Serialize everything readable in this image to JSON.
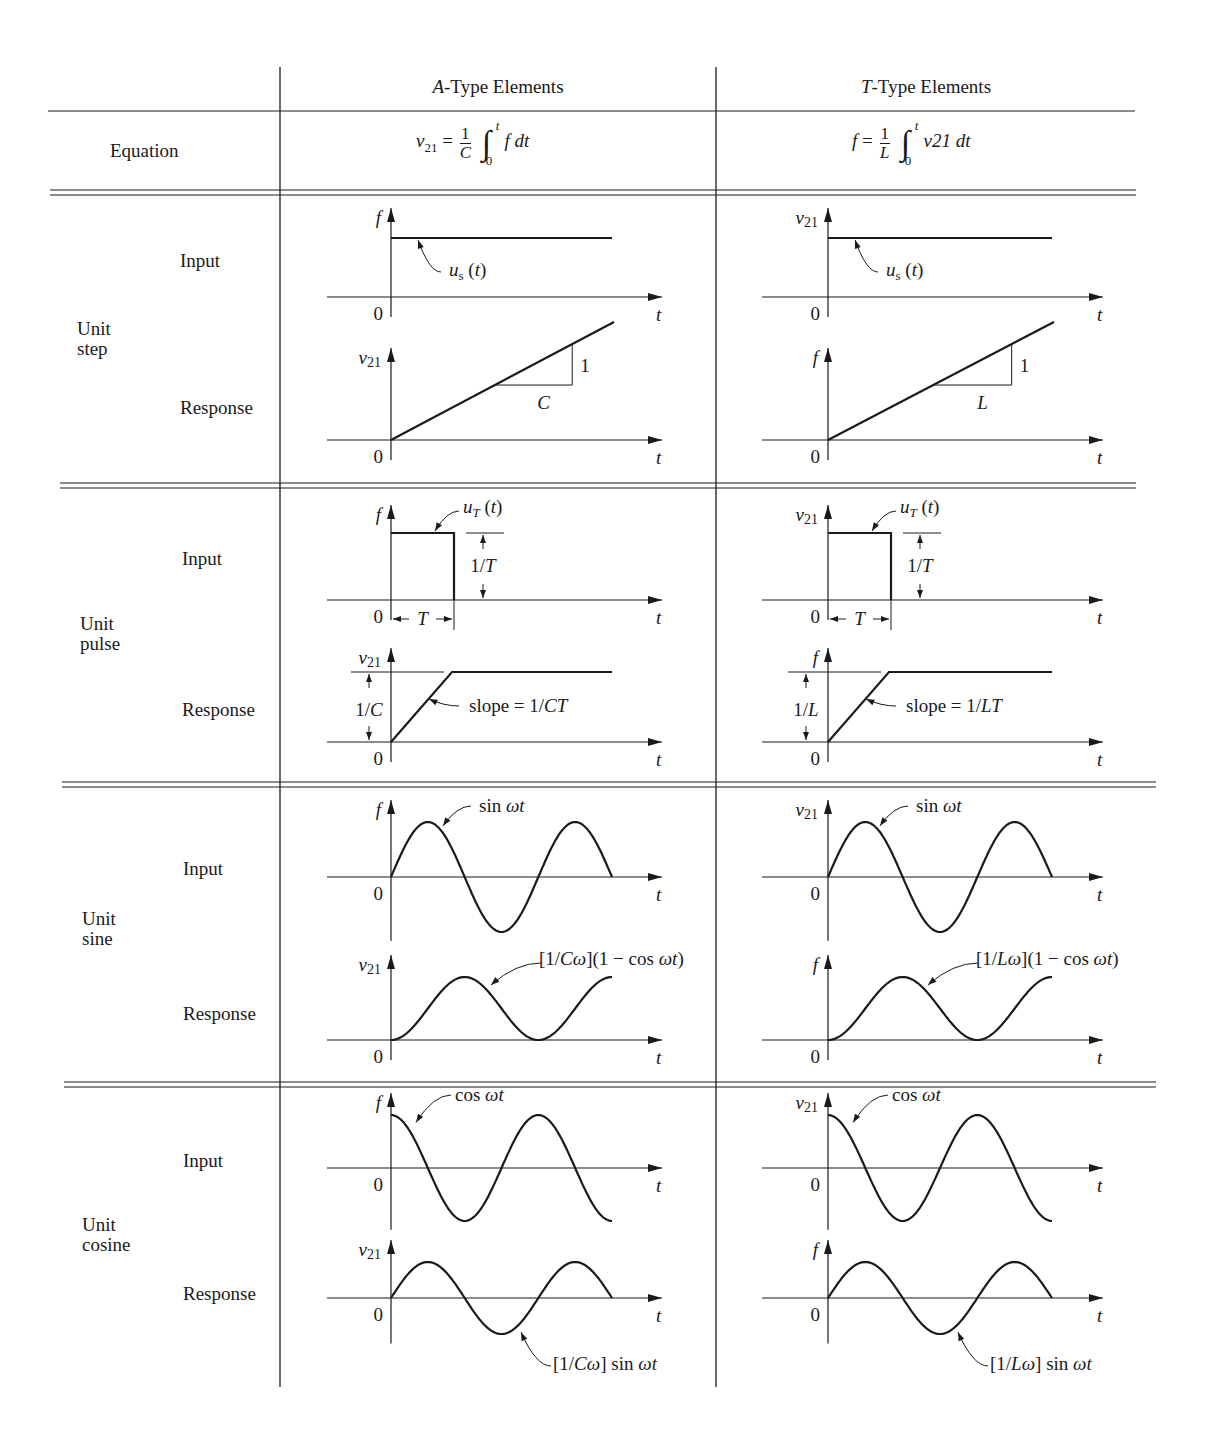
{
  "table": {
    "columns": [
      {
        "prefix": "A",
        "suffix": "-Type Elements"
      },
      {
        "prefix": "T",
        "suffix": "-Type Elements"
      }
    ],
    "equation_label": "Equation",
    "equations": [
      {
        "lhs": "v",
        "lhs_sub": "21",
        "num": "1",
        "den": "C",
        "upper": "t",
        "lower": "0",
        "integrand": "f dt"
      },
      {
        "lhs": "f",
        "lhs_sub": "",
        "num": "1",
        "den": "L",
        "upper": "t",
        "lower": "0",
        "integrand": "v21 dt"
      }
    ],
    "row_groups": [
      {
        "name": "Unit\nstep",
        "input_label": "Input",
        "response_label": "Response"
      },
      {
        "name": "Unit\npulse",
        "input_label": "Input",
        "response_label": "Response"
      },
      {
        "name": "Unit\nsine",
        "input_label": "Input",
        "response_label": "Response"
      },
      {
        "name": "Unit\ncosine",
        "input_label": "Input",
        "response_label": "Response"
      }
    ]
  },
  "chart_data": [
    {
      "type": "line",
      "title": "Unit step input (A-type)",
      "ylabel": "f",
      "xlabel": "t",
      "origin_label": "0",
      "curve": "step",
      "annotation": "u_s(t)"
    },
    {
      "type": "line",
      "title": "Unit step response (A-type)",
      "ylabel": "v21",
      "xlabel": "t",
      "origin_label": "0",
      "curve": "ramp",
      "slope_run_label": "C",
      "slope_rise_label": "1"
    },
    {
      "type": "line",
      "title": "Unit step input (T-type)",
      "ylabel": "v21",
      "xlabel": "t",
      "origin_label": "0",
      "curve": "step",
      "annotation": "u_s(t)"
    },
    {
      "type": "line",
      "title": "Unit step response (T-type)",
      "ylabel": "f",
      "xlabel": "t",
      "origin_label": "0",
      "curve": "ramp",
      "slope_run_label": "L",
      "slope_rise_label": "1"
    },
    {
      "type": "line",
      "title": "Unit pulse input (A-type)",
      "ylabel": "f",
      "xlabel": "t",
      "origin_label": "0",
      "curve": "pulse",
      "annotation": "u_T(t)",
      "height_label": "1/T",
      "width_label": "T"
    },
    {
      "type": "line",
      "title": "Unit pulse response (A-type)",
      "ylabel": "v21",
      "xlabel": "t",
      "origin_label": "0",
      "curve": "ramp_sat",
      "height_label": "1/C",
      "annotation": "slope = 1/CT"
    },
    {
      "type": "line",
      "title": "Unit pulse input (T-type)",
      "ylabel": "v21",
      "xlabel": "t",
      "origin_label": "0",
      "curve": "pulse",
      "annotation": "u_T(t)",
      "height_label": "1/T",
      "width_label": "T"
    },
    {
      "type": "line",
      "title": "Unit pulse response (T-type)",
      "ylabel": "f",
      "xlabel": "t",
      "origin_label": "0",
      "curve": "ramp_sat",
      "height_label": "1/L",
      "annotation": "slope = 1/LT"
    },
    {
      "type": "line",
      "title": "Unit sine input (A-type)",
      "ylabel": "f",
      "xlabel": "t",
      "origin_label": "0",
      "curve": "sin",
      "cycles": 1.5,
      "annotation": "sin ωt"
    },
    {
      "type": "line",
      "title": "Unit sine response (A-type)",
      "ylabel": "v21",
      "xlabel": "t",
      "origin_label": "0",
      "curve": "one_minus_cos",
      "cycles": 1.5,
      "annotation": "[1/Cω](1 − cos ωt)"
    },
    {
      "type": "line",
      "title": "Unit sine input (T-type)",
      "ylabel": "v21",
      "xlabel": "t",
      "origin_label": "0",
      "curve": "sin",
      "cycles": 1.5,
      "annotation": "sin ωt"
    },
    {
      "type": "line",
      "title": "Unit sine response (T-type)",
      "ylabel": "f",
      "xlabel": "t",
      "origin_label": "0",
      "curve": "one_minus_cos",
      "cycles": 1.5,
      "annotation": "[1/Lω](1 − cos ωt)"
    },
    {
      "type": "line",
      "title": "Unit cosine input (A-type)",
      "ylabel": "f",
      "xlabel": "t",
      "origin_label": "0",
      "curve": "cos",
      "cycles": 1.5,
      "annotation": "cos ωt"
    },
    {
      "type": "line",
      "title": "Unit cosine response (A-type)",
      "ylabel": "v21",
      "xlabel": "t",
      "origin_label": "0",
      "curve": "sin",
      "cycles": 1.5,
      "annotation": "[1/Cω] sin ωt"
    },
    {
      "type": "line",
      "title": "Unit cosine input (T-type)",
      "ylabel": "v21",
      "xlabel": "t",
      "origin_label": "0",
      "curve": "cos",
      "cycles": 1.5,
      "annotation": "cos ωt"
    },
    {
      "type": "line",
      "title": "Unit cosine response (T-type)",
      "ylabel": "f",
      "xlabel": "t",
      "origin_label": "0",
      "curve": "sin",
      "cycles": 1.5,
      "annotation": "[1/Lω] sin ωt"
    }
  ]
}
